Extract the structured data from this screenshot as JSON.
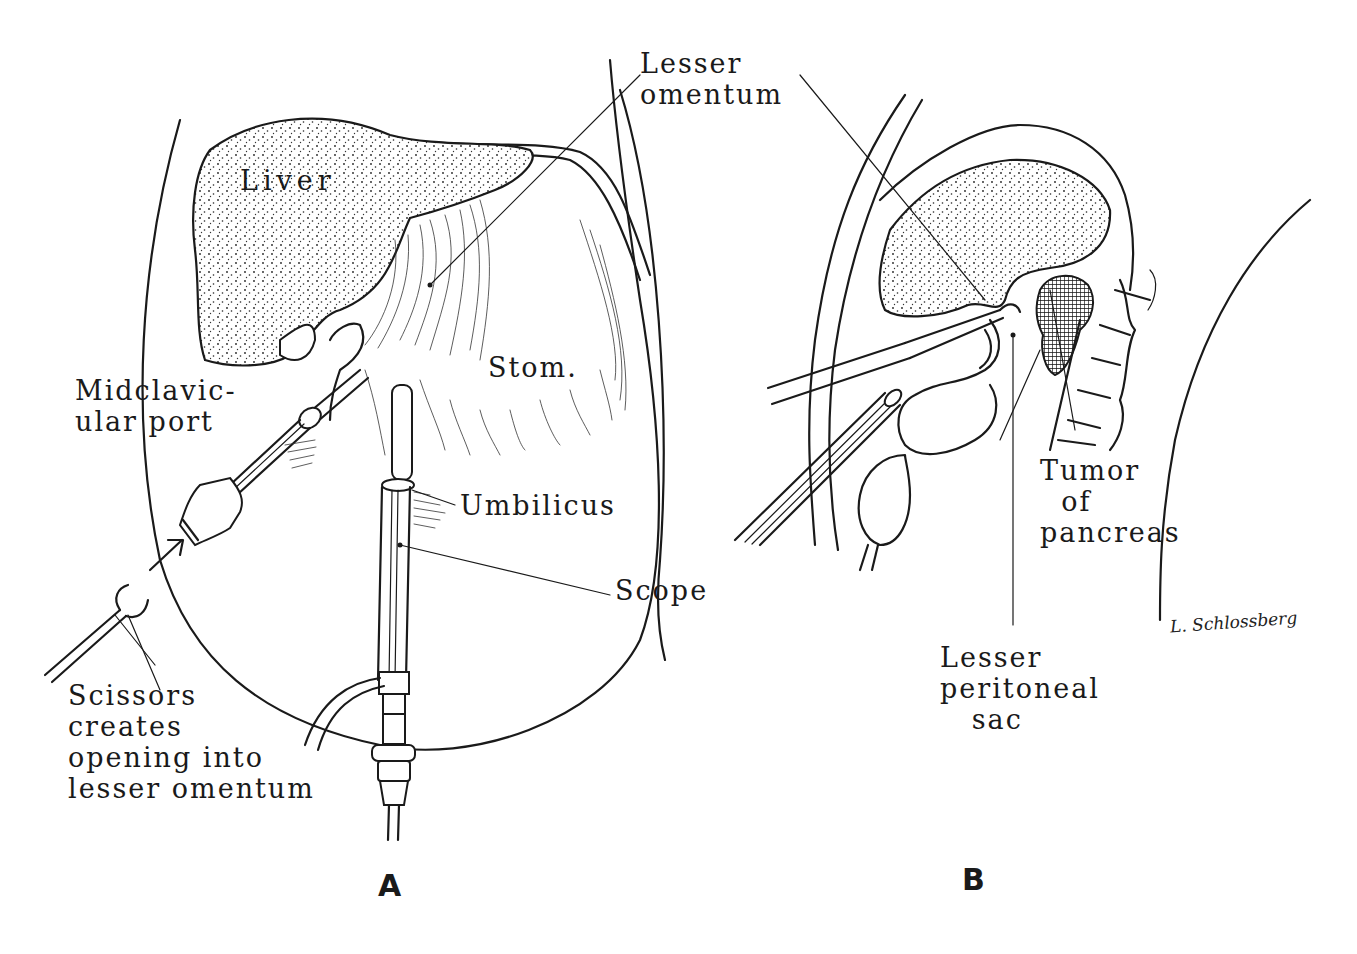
{
  "figure": {
    "panels": [
      {
        "id": "A",
        "letter": "A",
        "labels": {
          "liver": "Liver",
          "stomach": "Stom.",
          "midclavicular_port": "Midclavic-\nular port",
          "umbilicus": "Umbilicus",
          "scope": "Scope",
          "scissors": "Scissors\ncreates\nopening into\nlesser omentum"
        }
      },
      {
        "id": "B",
        "letter": "B",
        "labels": {
          "tumor": "Tumor\n  of\npancreas",
          "lesser_peritoneal_sac": "Lesser\nperitoneal\n   sac"
        }
      }
    ],
    "shared_labels": {
      "lesser_omentum": "Lesser\nomentum"
    },
    "signature": "L. Schlossberg",
    "colors": {
      "ink": "#1a1a1a",
      "background": "#ffffff"
    }
  }
}
